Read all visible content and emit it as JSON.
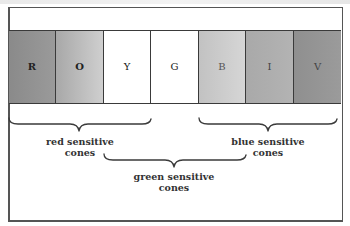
{
  "diagram": {
    "type": "visible-spectrum-cone-sensitivity",
    "bands": [
      {
        "letter": "R",
        "color_name": "red",
        "fill": "#8a8a8a",
        "fill_end": "#9a9a9a",
        "width": 47
      },
      {
        "letter": "O",
        "color_name": "orange",
        "fill": "#a8a8a8",
        "fill_end": "#cfcfcf",
        "width": 48
      },
      {
        "letter": "Y",
        "color_name": "yellow",
        "fill": "#ffffff",
        "fill_end": "#ffffff",
        "width": 47
      },
      {
        "letter": "G",
        "color_name": "green",
        "fill": "#ffffff",
        "fill_end": "#ffffff",
        "width": 48
      },
      {
        "letter": "B",
        "color_name": "blue",
        "fill": "#c2c2c2",
        "fill_end": "#dadada",
        "width": 47
      },
      {
        "letter": "I",
        "color_name": "indigo",
        "fill": "#a9a9a9",
        "fill_end": "#b4b4b4",
        "width": 48
      },
      {
        "letter": "V",
        "color_name": "violet",
        "fill": "#8f8f8f",
        "fill_end": "#9c9c9c",
        "width": 47
      }
    ],
    "groups": [
      {
        "id": "red",
        "label_line1": "red sensitive",
        "label_line2": "cones",
        "span": "R–Y"
      },
      {
        "id": "green",
        "label_line1": "green sensitive",
        "label_line2": "cones",
        "span": "Y–B"
      },
      {
        "id": "blue",
        "label_line1": "blue sensitive",
        "label_line2": "cones",
        "span": "B–V"
      }
    ]
  }
}
